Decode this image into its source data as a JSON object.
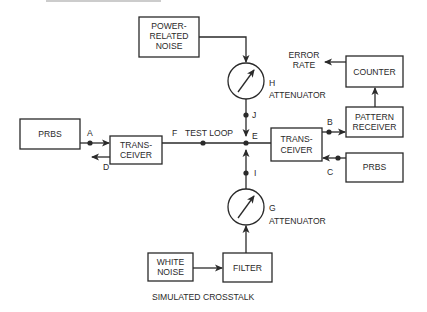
{
  "diagram": {
    "caption": "SIMULATED CROSSTALK",
    "blocks": {
      "power_noise": [
        "POWER-",
        "RELATED",
        "NOISE"
      ],
      "prbs_left": "PRBS",
      "transceiver_left": [
        "TRANS-",
        "CEIVER"
      ],
      "transceiver_right": [
        "TRANS-",
        "CEIVER"
      ],
      "counter": "COUNTER",
      "pattern_receiver": [
        "PATTERN",
        "RECEIVER"
      ],
      "prbs_right": "PRBS",
      "white_noise": [
        "WHITE",
        "NOISE"
      ],
      "filter": "FILTER"
    },
    "attenuators": {
      "h": {
        "letter": "H",
        "label": "ATTENUATOR"
      },
      "g": {
        "letter": "G",
        "label": "ATTENUATOR"
      }
    },
    "outputs": {
      "error_rate": [
        "ERROR",
        "RATE"
      ]
    },
    "points": {
      "a": "A",
      "b": "B",
      "c": "C",
      "d": "D",
      "e": "E",
      "f": "F",
      "i": "I",
      "j": "J"
    },
    "test_loop_label": "TEST LOOP"
  }
}
